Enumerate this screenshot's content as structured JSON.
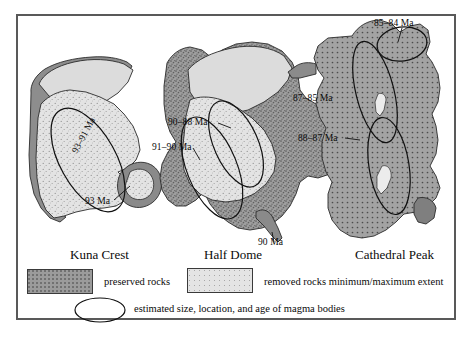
{
  "figure": {
    "background": "#ffffff",
    "frame_color": "#595959",
    "panels": [
      {
        "id": "kuna-crest",
        "title": "Kuna Crest",
        "ages": [
          {
            "text": "93–91 Ma",
            "rotated": true
          },
          {
            "text": "93 Ma",
            "rotated": false
          }
        ]
      },
      {
        "id": "half-dome",
        "title": "Half Dome",
        "ages": [
          {
            "text": "90–88 Ma",
            "rotated": false
          },
          {
            "text": "91–90 Ma",
            "rotated": false
          },
          {
            "text": "90 Ma",
            "rotated": false
          }
        ]
      },
      {
        "id": "cathedral-peak",
        "title": "Cathedral Peak",
        "ages": [
          {
            "text": "85–84 Ma",
            "rotated": false
          },
          {
            "text": "87–85 Ma",
            "rotated": false
          },
          {
            "text": "88–87 Ma",
            "rotated": false
          }
        ]
      }
    ]
  },
  "labels": {
    "kuna_age_main": "93–91 Ma",
    "kuna_age_small": "93 Ma",
    "halfdome_age_upper": "90–88 Ma",
    "halfdome_age_lower": "91–90 Ma",
    "halfdome_age_bottom": "90 Ma",
    "cathedral_age_top": "85–84 Ma",
    "cathedral_age_mid": "87–85 Ma",
    "cathedral_age_low": "88–87 Ma"
  },
  "titles": {
    "kuna": "Kuna Crest",
    "halfdome": "Half Dome",
    "cathedral": "Cathedral Peak"
  },
  "legend": {
    "preserved_label": "preserved rocks",
    "removed_label": "removed rocks minimum/maximum extent",
    "ellipse_label": "estimated size, location, and age of magma bodies",
    "preserved_color": "#9b9b9b",
    "removed_color": "#dedede",
    "ellipse_stroke": "#111111"
  },
  "colors": {
    "preserved_fill": "#9b9b9b",
    "removed_fill": "#dcdcdc",
    "removed_fill_light": "#e6e6e6",
    "outline": "#2b2b2b",
    "dark_rim": "#7a7a7a",
    "frame": "#595959"
  }
}
